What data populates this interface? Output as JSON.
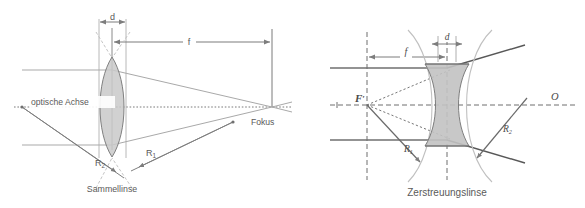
{
  "figure": {
    "background": "#ffffff",
    "width": 585,
    "height": 208
  },
  "colors": {
    "ray": "#808080",
    "ray_light": "#a9a9a9",
    "axis": "#7a7a7a",
    "lens_fill": "#c8c8c8",
    "lens_stroke": "#808080",
    "arc": "#b9b9b9",
    "text": "#5a5a5a",
    "dashed": "#6e6e6e"
  },
  "diagrams": [
    {
      "id": "converging",
      "caption": "Sammellinse",
      "axis_label": "optische Achse",
      "focus_label": "Fokus",
      "thickness_label": "d",
      "focal_label": "f",
      "radius_labels": [
        {
          "base": "R",
          "sub": "1"
        },
        {
          "base": "R",
          "sub": "2"
        }
      ],
      "lens_type": "biconvex",
      "ray_heights": [
        70,
        145
      ],
      "focus_point": {
        "x": 272,
        "y": 107
      },
      "lens_center": {
        "x": 112,
        "y": 107
      }
    },
    {
      "id": "diverging",
      "caption": "Zerstreuungslinse",
      "focal_point_label": "F",
      "focal_point_prime": "′",
      "origin_label": "O",
      "thickness_label": "d",
      "focal_label": "f",
      "radius_labels": [
        {
          "base": "R",
          "sub": "1"
        },
        {
          "base": "R",
          "sub": "2"
        }
      ],
      "lens_type": "biconcave",
      "ray_heights": [
        68,
        140
      ],
      "focal_point": {
        "x": 367,
        "y": 105
      },
      "lens_center": {
        "x": 447,
        "y": 105
      }
    }
  ]
}
